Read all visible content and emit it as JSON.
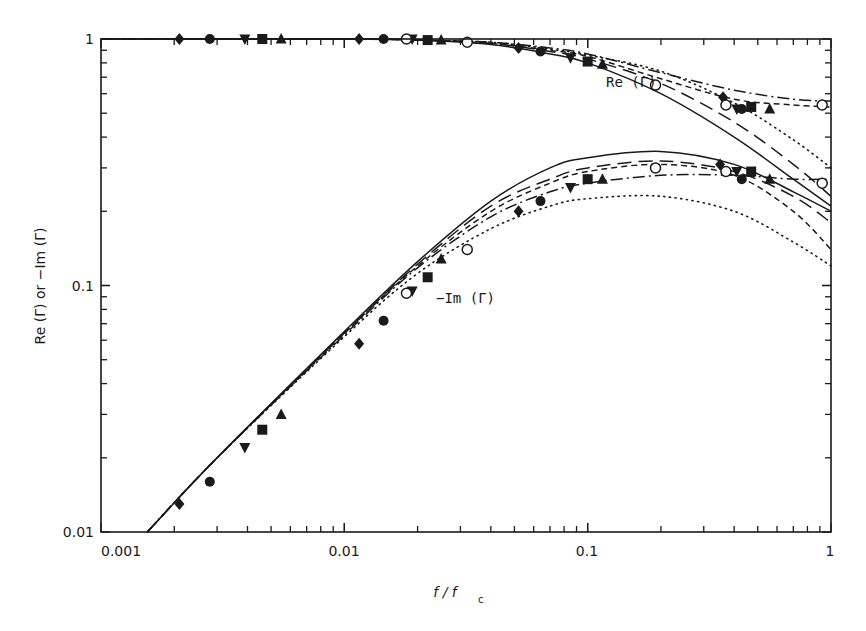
{
  "chart_data": {
    "type": "line",
    "title": "",
    "xlabel": "f/f_c",
    "xlabel_main": "f / f",
    "xlabel_sub": "c",
    "ylabel": "Re (Γ) or −Im (Γ)",
    "xscale": "log",
    "yscale": "log",
    "xlim": [
      0.001,
      1
    ],
    "ylim": [
      0.01,
      1
    ],
    "grid": false,
    "legend": "none",
    "x_tick_labels": [
      "0.001",
      "0.01",
      "0.1",
      "1"
    ],
    "y_tick_labels": [
      "0.01",
      "0.1",
      "1"
    ],
    "annotations": [
      {
        "text": "Re (Γ)",
        "x": 0.17,
        "y": 0.72
      },
      {
        "text": "−Im (Γ)",
        "x": 0.026,
        "y": 0.093
      }
    ],
    "series": [
      {
        "name": "Re(Γ) solid",
        "group": "Re",
        "style": "solid",
        "x": [
          0.001,
          0.01,
          0.02,
          0.04,
          0.07,
          0.1,
          0.2,
          0.4,
          0.7,
          1.0
        ],
        "y": [
          1.0,
          1.0,
          0.99,
          0.95,
          0.87,
          0.8,
          0.6,
          0.4,
          0.27,
          0.21
        ]
      },
      {
        "name": "Re(Γ) long-dash",
        "group": "Re",
        "style": "longdash",
        "x": [
          0.001,
          0.01,
          0.02,
          0.04,
          0.07,
          0.1,
          0.2,
          0.4,
          0.7,
          1.0
        ],
        "y": [
          1.0,
          1.0,
          0.99,
          0.96,
          0.89,
          0.83,
          0.66,
          0.46,
          0.31,
          0.23
        ]
      },
      {
        "name": "Re(Γ) dotted",
        "group": "Re",
        "style": "dotted",
        "x": [
          0.001,
          0.01,
          0.02,
          0.04,
          0.07,
          0.1,
          0.2,
          0.4,
          0.7,
          1.0
        ],
        "y": [
          1.0,
          1.0,
          0.99,
          0.97,
          0.91,
          0.86,
          0.74,
          0.55,
          0.39,
          0.3
        ]
      },
      {
        "name": "Re(Γ) dash-dot",
        "group": "Re",
        "style": "dashdot",
        "x": [
          0.001,
          0.01,
          0.02,
          0.04,
          0.07,
          0.1,
          0.2,
          0.4,
          0.7,
          1.0
        ],
        "y": [
          1.0,
          1.0,
          0.99,
          0.97,
          0.92,
          0.87,
          0.73,
          0.62,
          0.57,
          0.56
        ]
      },
      {
        "name": "Re(Γ) short-dash",
        "group": "Re",
        "style": "shortdash",
        "x": [
          0.001,
          0.01,
          0.02,
          0.04,
          0.07,
          0.1,
          0.2,
          0.4,
          0.7,
          1.0
        ],
        "y": [
          1.0,
          1.0,
          0.99,
          0.96,
          0.9,
          0.85,
          0.69,
          0.57,
          0.54,
          0.53
        ]
      },
      {
        "name": "-Im(Γ) solid",
        "group": "Im",
        "style": "solid",
        "x": [
          0.00155,
          0.003,
          0.01,
          0.02,
          0.04,
          0.07,
          0.1,
          0.2,
          0.4,
          0.7,
          1.0
        ],
        "y": [
          0.01,
          0.02,
          0.065,
          0.125,
          0.22,
          0.3,
          0.33,
          0.35,
          0.31,
          0.24,
          0.2
        ]
      },
      {
        "name": "-Im(Γ) long-dash",
        "group": "Im",
        "style": "longdash",
        "x": [
          0.00155,
          0.003,
          0.01,
          0.02,
          0.04,
          0.07,
          0.1,
          0.2,
          0.4,
          0.7,
          1.0
        ],
        "y": [
          0.01,
          0.02,
          0.064,
          0.122,
          0.21,
          0.27,
          0.3,
          0.32,
          0.29,
          0.23,
          0.18
        ]
      },
      {
        "name": "-Im(Γ) dotted",
        "group": "Im",
        "style": "dotted",
        "x": [
          0.00155,
          0.003,
          0.01,
          0.02,
          0.04,
          0.07,
          0.1,
          0.2,
          0.4,
          0.7,
          1.0
        ],
        "y": [
          0.01,
          0.02,
          0.062,
          0.112,
          0.17,
          0.21,
          0.225,
          0.23,
          0.2,
          0.15,
          0.12
        ]
      },
      {
        "name": "-Im(Γ) dash-dot",
        "group": "Im",
        "style": "dashdot",
        "x": [
          0.00155,
          0.003,
          0.01,
          0.02,
          0.04,
          0.07,
          0.1,
          0.2,
          0.4,
          0.7,
          1.0
        ],
        "y": [
          0.01,
          0.02,
          0.063,
          0.118,
          0.19,
          0.24,
          0.26,
          0.28,
          0.28,
          0.27,
          0.27
        ]
      },
      {
        "name": "-Im(Γ) short-dash",
        "group": "Im",
        "style": "shortdash",
        "x": [
          0.00155,
          0.003,
          0.01,
          0.02,
          0.04,
          0.07,
          0.1,
          0.2,
          0.4,
          0.7,
          1.0
        ],
        "y": [
          0.01,
          0.02,
          0.064,
          0.12,
          0.2,
          0.26,
          0.29,
          0.31,
          0.28,
          0.2,
          0.14
        ]
      }
    ],
    "markers": [
      {
        "group": "Re",
        "shape": "diamond",
        "points": [
          [
            0.0021,
            1.0
          ],
          [
            0.0115,
            1.0
          ],
          [
            0.052,
            0.92
          ],
          [
            0.36,
            0.58
          ]
        ]
      },
      {
        "group": "Re",
        "shape": "circle",
        "points": [
          [
            0.0028,
            1.0
          ],
          [
            0.0145,
            1.0
          ],
          [
            0.064,
            0.89
          ],
          [
            0.43,
            0.52
          ]
        ]
      },
      {
        "group": "Re",
        "shape": "triangle-down",
        "points": [
          [
            0.0039,
            1.0
          ],
          [
            0.019,
            1.0
          ],
          [
            0.085,
            0.84
          ],
          [
            0.41,
            0.52
          ]
        ]
      },
      {
        "group": "Re",
        "shape": "square",
        "points": [
          [
            0.0046,
            1.0
          ],
          [
            0.022,
            0.99
          ],
          [
            0.1,
            0.81
          ],
          [
            0.47,
            0.53
          ]
        ]
      },
      {
        "group": "Re",
        "shape": "triangle-up",
        "points": [
          [
            0.0055,
            1.0
          ],
          [
            0.025,
            0.99
          ],
          [
            0.115,
            0.79
          ],
          [
            0.56,
            0.52
          ]
        ]
      },
      {
        "group": "Re",
        "shape": "open-circle",
        "points": [
          [
            0.018,
            1.0
          ],
          [
            0.032,
            0.97
          ],
          [
            0.19,
            0.65
          ],
          [
            0.37,
            0.54
          ],
          [
            0.92,
            0.54
          ]
        ]
      },
      {
        "group": "Im",
        "shape": "diamond",
        "points": [
          [
            0.0021,
            0.013
          ],
          [
            0.0115,
            0.058
          ],
          [
            0.052,
            0.2
          ],
          [
            0.35,
            0.31
          ]
        ]
      },
      {
        "group": "Im",
        "shape": "circle",
        "points": [
          [
            0.0028,
            0.016
          ],
          [
            0.0145,
            0.072
          ],
          [
            0.064,
            0.22
          ],
          [
            0.43,
            0.27
          ]
        ]
      },
      {
        "group": "Im",
        "shape": "triangle-down",
        "points": [
          [
            0.0039,
            0.022
          ],
          [
            0.019,
            0.095
          ],
          [
            0.085,
            0.25
          ],
          [
            0.41,
            0.29
          ]
        ]
      },
      {
        "group": "Im",
        "shape": "square",
        "points": [
          [
            0.0046,
            0.026
          ],
          [
            0.022,
            0.108
          ],
          [
            0.1,
            0.27
          ],
          [
            0.47,
            0.29
          ]
        ]
      },
      {
        "group": "Im",
        "shape": "triangle-up",
        "points": [
          [
            0.0055,
            0.03
          ],
          [
            0.025,
            0.128
          ],
          [
            0.115,
            0.27
          ],
          [
            0.56,
            0.27
          ]
        ]
      },
      {
        "group": "Im",
        "shape": "open-circle",
        "points": [
          [
            0.018,
            0.093
          ],
          [
            0.032,
            0.14
          ],
          [
            0.19,
            0.3
          ],
          [
            0.37,
            0.29
          ],
          [
            0.92,
            0.26
          ]
        ]
      }
    ]
  }
}
